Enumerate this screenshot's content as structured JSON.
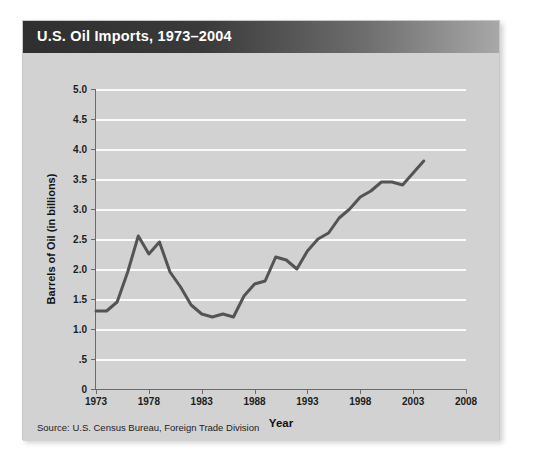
{
  "card": {
    "title": "U.S. Oil Imports, 1973–2004",
    "source": "Source:  U.S. Census Bureau, Foreign Trade Division",
    "header_gradient_from": "#2f2f2f",
    "header_gradient_to": "#a8a8a8",
    "body_background": "#d2d2d2",
    "line_color": "#545454"
  },
  "chart_data": {
    "type": "line",
    "title": "U.S. Oil Imports, 1973–2004",
    "xlabel": "Year",
    "ylabel": "Barrels of Oil (in billions)",
    "xlim": [
      1973,
      2008
    ],
    "ylim": [
      0,
      5.0
    ],
    "grid": true,
    "legend": "none",
    "xticks": [
      1973,
      1978,
      1983,
      1988,
      1993,
      1998,
      2003,
      2008
    ],
    "xtick_labels": [
      "1973",
      "1978",
      "1983",
      "1988",
      "1993",
      "1998",
      "2003",
      "2008"
    ],
    "yticks": [
      0,
      0.5,
      1.0,
      1.5,
      2.0,
      2.5,
      3.0,
      3.5,
      4.0,
      4.5,
      5.0
    ],
    "ytick_labels": [
      "0",
      ".5",
      "1.0",
      "1.5",
      "2.0",
      "2.5",
      "3.0",
      "3.5",
      "4.0",
      "4.5",
      "5.0"
    ],
    "x": [
      1973,
      1974,
      1975,
      1976,
      1977,
      1978,
      1979,
      1980,
      1981,
      1982,
      1983,
      1984,
      1985,
      1986,
      1987,
      1988,
      1989,
      1990,
      1991,
      1992,
      1993,
      1994,
      1995,
      1996,
      1997,
      1998,
      1999,
      2000,
      2001,
      2002,
      2003,
      2004
    ],
    "values": [
      1.3,
      1.3,
      1.45,
      1.95,
      2.55,
      2.25,
      2.45,
      1.95,
      1.7,
      1.4,
      1.25,
      1.2,
      1.25,
      1.2,
      1.55,
      1.75,
      1.8,
      2.2,
      2.15,
      2.0,
      2.3,
      2.5,
      2.6,
      2.85,
      3.0,
      3.2,
      3.3,
      3.45,
      3.45,
      3.4,
      3.6,
      3.8
    ],
    "series": [
      {
        "name": "Barrels of Oil (in billions)",
        "values": [
          1.3,
          1.3,
          1.45,
          1.95,
          2.55,
          2.25,
          2.45,
          1.95,
          1.7,
          1.4,
          1.25,
          1.2,
          1.25,
          1.2,
          1.55,
          1.75,
          1.8,
          2.2,
          2.15,
          2.0,
          2.3,
          2.5,
          2.6,
          2.85,
          3.0,
          3.2,
          3.3,
          3.45,
          3.45,
          3.4,
          3.6,
          3.8
        ]
      }
    ]
  }
}
